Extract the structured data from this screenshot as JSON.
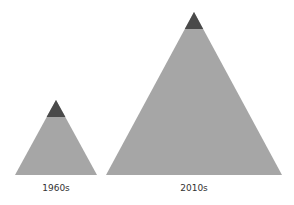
{
  "diagram": {
    "colors": {
      "body": "#a6a6a6",
      "cap": "#4a4a4a"
    },
    "pyramids": [
      {
        "label": "1960s"
      },
      {
        "label": "2010s"
      }
    ]
  }
}
